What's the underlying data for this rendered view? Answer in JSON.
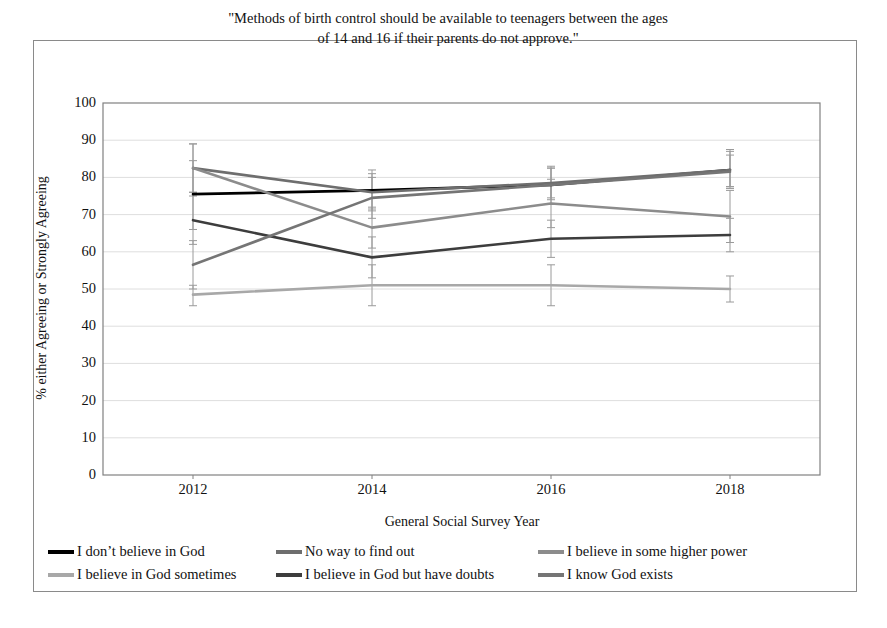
{
  "figure": {
    "title_line1": "\"Methods of birth control should be available to teenagers between the ages",
    "title_line2": "of 14 and 16 if their parents do not approve.\""
  },
  "chart_data": {
    "type": "line",
    "title": "\"Methods of birth control should be available to teenagers between the ages of 14 and 16 if their parents do not approve.\"",
    "xlabel": "General Social Survey Year",
    "ylabel": "% either Agreeing or Strongly Agreeing",
    "x": [
      2012,
      2014,
      2016,
      2018
    ],
    "xtick_labels": [
      "2012",
      "2014",
      "2016",
      "2018"
    ],
    "ytick_labels": [
      "0",
      "10",
      "20",
      "30",
      "40",
      "50",
      "60",
      "70",
      "80",
      "90",
      "100"
    ],
    "ylim": [
      0,
      100
    ],
    "ytick_step": 10,
    "grid": true,
    "grid_axis": "y",
    "legend_position": "bottom",
    "error_bars": true,
    "series": [
      {
        "name": "I don't believe in God",
        "color": "#000000",
        "values": [
          75.5,
          76.5,
          78.0,
          82.0
        ],
        "err_low": [
          66.0,
          71.0,
          74.0,
          77.5
        ],
        "err_high": [
          84.5,
          82.0,
          82.5,
          87.0
        ]
      },
      {
        "name": "No way to find out",
        "color": "#6e6e6e",
        "values": [
          82.5,
          76.0,
          78.5,
          82.0
        ],
        "err_low": [
          76.0,
          71.5,
          74.5,
          77.5
        ],
        "err_high": [
          89.0,
          81.0,
          82.5,
          87.5
        ]
      },
      {
        "name": "I believe in some higher power",
        "color": "#8c8c8c",
        "values": [
          82.5,
          66.5,
          73.0,
          69.5
        ],
        "err_low": [
          76.0,
          61.0,
          66.5,
          62.5
        ],
        "err_high": [
          89.0,
          72.0,
          79.5,
          76.5
        ]
      },
      {
        "name": "I believe in God sometimes",
        "color": "#a8a8a8",
        "values": [
          48.5,
          51.0,
          51.0,
          50.0
        ],
        "err_low": [
          45.5,
          45.5,
          45.5,
          46.5
        ],
        "err_high": [
          51.0,
          56.5,
          56.5,
          53.5
        ]
      },
      {
        "name": "I believe in God but have doubts",
        "color": "#3d3d3d",
        "values": [
          68.5,
          58.5,
          63.5,
          64.5
        ],
        "err_low": [
          62.0,
          53.0,
          58.5,
          60.0
        ],
        "err_high": [
          75.0,
          64.0,
          68.5,
          69.0
        ]
      },
      {
        "name": "I know God exists",
        "color": "#757575",
        "values": [
          56.5,
          74.5,
          78.0,
          81.5
        ],
        "err_low": [
          50.0,
          69.0,
          73.0,
          77.0
        ],
        "err_high": [
          63.0,
          80.0,
          83.0,
          86.0
        ]
      }
    ]
  },
  "legend": {
    "rows": [
      [
        {
          "label": "I don’t believe in God",
          "color": "#000000"
        },
        {
          "label": "No way to find out",
          "color": "#6e6e6e"
        },
        {
          "label": "I believe in some higher power",
          "color": "#8c8c8c"
        }
      ],
      [
        {
          "label": "I believe in God sometimes",
          "color": "#a8a8a8"
        },
        {
          "label": "I believe in God but have doubts",
          "color": "#3d3d3d"
        },
        {
          "label": "I know God exists",
          "color": "#757575"
        }
      ]
    ]
  }
}
